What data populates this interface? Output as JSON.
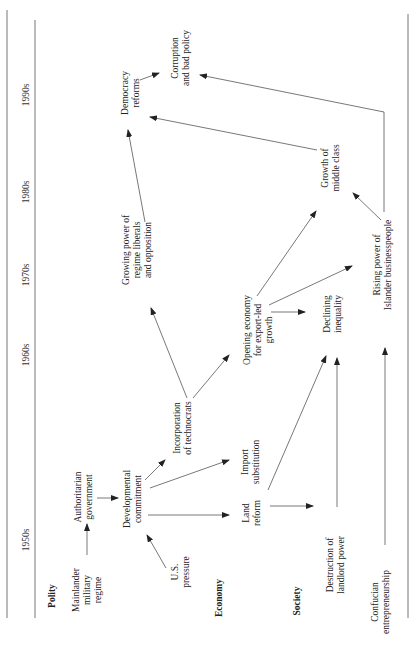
{
  "decades": [
    "1950s",
    "1960s",
    "1970s",
    "1980s",
    "1990s"
  ],
  "rows": {
    "polity": "Polity",
    "economy": "Economy",
    "society": "Society"
  },
  "nodes": {
    "mainlander": [
      "Mainlander",
      "military",
      "regime"
    ],
    "authoritarian": [
      "Authoritarian",
      "government"
    ],
    "developmental": [
      "Developmental",
      "commitment"
    ],
    "us_pressure": [
      "U.S.",
      "pressure"
    ],
    "incorporation": [
      "Incorporation",
      "of technocrats"
    ],
    "growing_power": [
      "Growing power of",
      "regime liberals",
      "and opposition"
    ],
    "democracy": [
      "Democracy",
      "reforms"
    ],
    "corruption": [
      "Corruption",
      "and bad policy"
    ],
    "land_reform": [
      "Land",
      "reform"
    ],
    "import_sub": [
      "Import",
      "substitution"
    ],
    "opening": [
      "Opening economy",
      "for export-led",
      "growth"
    ],
    "destruction": [
      "Destruction of",
      "landlord power"
    ],
    "declining": [
      "Declining",
      "inequality"
    ],
    "growth_middle": [
      "Growth of",
      "middle class"
    ],
    "confucian": [
      "Confucian",
      "entrepreneurship"
    ],
    "rising_power": [
      "Rising power of",
      "Islander businesspeople"
    ]
  }
}
